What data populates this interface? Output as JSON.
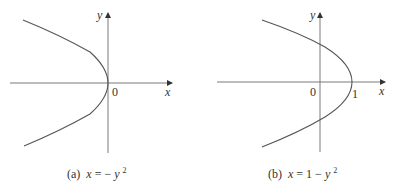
{
  "figure": {
    "panels": [
      {
        "id": "a",
        "caption_prefix": "(a)",
        "caption_lhs": "x",
        "caption_eq": " = ",
        "caption_rhs_pre": "−",
        "caption_rhs_var": "y",
        "caption_rhs_exp": "2",
        "axis_x_label": "x",
        "axis_y_label": "y",
        "origin_label": "0",
        "equation": "x = −y^2"
      },
      {
        "id": "b",
        "caption_prefix": "(b)",
        "caption_lhs": "x",
        "caption_eq": " = ",
        "caption_rhs_pre": "1 − ",
        "caption_rhs_var": "y",
        "caption_rhs_exp": "2",
        "axis_x_label": "x",
        "axis_y_label": "y",
        "origin_label": "0",
        "vertex_label": "1",
        "equation": "x = 1 − y^2"
      }
    ],
    "colors": {
      "curve": "#555555",
      "axis": "#7a7a7a",
      "text": "#333333",
      "background": "#ffffff"
    }
  }
}
